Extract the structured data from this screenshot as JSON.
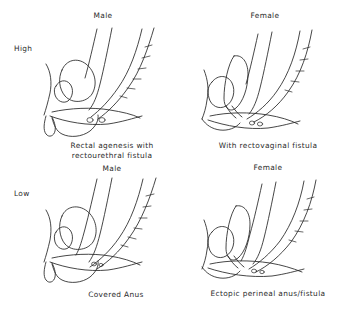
{
  "figure": {
    "kind": "anorectal-malformation-classification-diagram",
    "columns": [
      {
        "key": "male",
        "label": "Male"
      },
      {
        "key": "female",
        "label": "Female"
      }
    ],
    "rows": [
      {
        "key": "high",
        "label": "High"
      },
      {
        "key": "low",
        "label": "Low"
      }
    ],
    "panels": {
      "top_left": {
        "column_header": "Male",
        "row_label": "High",
        "caption": "Rectal agenesis with rectourethral fistula"
      },
      "top_right": {
        "column_header": "Female",
        "row_label": "High",
        "caption": "With rectovaginal fistula"
      },
      "bottom_left": {
        "column_header": "Male",
        "row_label": "Low",
        "caption": "Covered Anus"
      },
      "bottom_right": {
        "column_header": "Female",
        "row_label": "Low",
        "caption": "Ectopic perineal anus/fistula"
      }
    },
    "middle_headers": {
      "left": "Male",
      "right": "Female"
    },
    "colors": {
      "background": "#ffffff",
      "ink": "#262626",
      "text": "#2b2b2b"
    }
  }
}
